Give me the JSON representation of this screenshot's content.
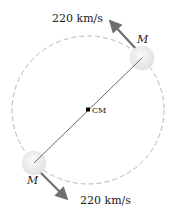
{
  "diagram": {
    "type": "binary star orbit",
    "orbit": {
      "style": "dashed",
      "color": "#b8b8b8",
      "center": [
        88,
        110
      ],
      "rx": 76,
      "ry": 74
    },
    "center_of_mass": {
      "label": "CM",
      "position": [
        88,
        110
      ],
      "color": "#000000"
    },
    "stars": [
      {
        "id": "upper",
        "label": "M",
        "position": [
          142,
          58
        ],
        "radius": 12,
        "fill": "#ececec",
        "velocity": {
          "label": "220 km/s",
          "direction": "up-left",
          "arrow_color": "#6e6e6e"
        }
      },
      {
        "id": "lower",
        "label": "M",
        "position": [
          34,
          163
        ],
        "radius": 12,
        "fill": "#ececec",
        "velocity": {
          "label": "220 km/s",
          "direction": "down-right",
          "arrow_color": "#6e6e6e"
        }
      }
    ],
    "connecting_line_color": "#444444"
  }
}
